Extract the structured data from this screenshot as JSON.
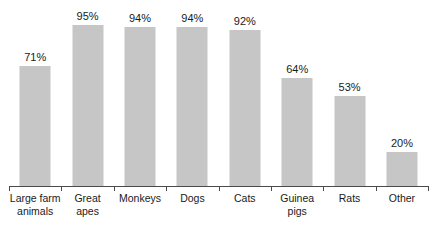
{
  "chart_data": {
    "type": "bar",
    "title": "",
    "subtitle": "",
    "xlabel": "",
    "ylabel": "",
    "ylim": [
      0,
      100
    ],
    "grid": false,
    "legend": null,
    "orientation": "vertical",
    "value_suffix": "%",
    "bar_color": "#c6c6c6",
    "axis_color": "#4a4a4a",
    "text_color": "#1a1a1a",
    "categories": [
      "Large farm animals",
      "Great apes",
      "Monkeys",
      "Dogs",
      "Cats",
      "Guinea pigs",
      "Rats",
      "Other"
    ],
    "category_lines": [
      [
        "Large farm",
        "animals"
      ],
      [
        "Great",
        "apes"
      ],
      [
        "Monkeys"
      ],
      [
        "Dogs"
      ],
      [
        "Cats"
      ],
      [
        "Guinea",
        "pigs"
      ],
      [
        "Rats"
      ],
      [
        "Other"
      ]
    ],
    "values": [
      71,
      95,
      94,
      94,
      92,
      64,
      53,
      20
    ],
    "data_labels": [
      "71%",
      "95%",
      "94%",
      "94%",
      "92%",
      "64%",
      "53%",
      "20%"
    ]
  }
}
